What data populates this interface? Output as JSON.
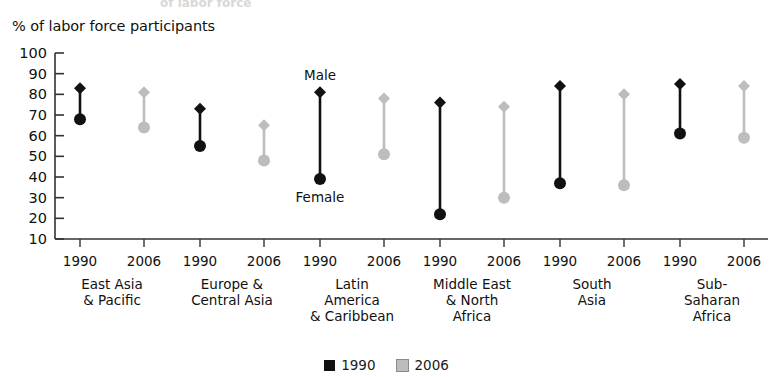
{
  "ghost_top_text": "of labor force",
  "axis_title": "% of labor force participants",
  "annotations": {
    "male_label": "Male",
    "female_label": "Female"
  },
  "legend": {
    "items": [
      {
        "label": "1990",
        "color": "#111111",
        "swatch": "black"
      },
      {
        "label": "2006",
        "color": "#bdbdbd",
        "swatch": "gray"
      }
    ]
  },
  "colors": {
    "series_1990": "#111111",
    "series_2006": "#bdbdbd",
    "axis": "#333333",
    "background": "#ffffff"
  },
  "chart_data": {
    "type": "scatter",
    "title": "% of labor force participants",
    "xlabel": "",
    "ylabel": "% of labor force participants",
    "ylim": [
      10,
      100
    ],
    "ytick_step": 10,
    "yticks": [
      10,
      20,
      30,
      40,
      50,
      60,
      70,
      80,
      90,
      100
    ],
    "grid": false,
    "legend_position": "bottom-center",
    "marker_top": "diamond (Male)",
    "marker_bottom": "circle (Female)",
    "categories": [
      "East Asia\n& Pacific",
      "Europe &\nCentral Asia",
      "Latin\nAmerica\n& Caribbean",
      "Middle East\n& North\nAfrica",
      "South\nAsia",
      "Sub-Saharan\nAfrica"
    ],
    "years": [
      "1990",
      "2006"
    ],
    "series": [
      {
        "name": "1990",
        "color": "#111111",
        "male": [
          83,
          73,
          81,
          76,
          84,
          85
        ],
        "female": [
          68,
          55,
          39,
          22,
          37,
          61
        ]
      },
      {
        "name": "2006",
        "color": "#bdbdbd",
        "male": [
          81,
          65,
          78,
          74,
          80,
          84
        ],
        "female": [
          64,
          48,
          51,
          30,
          36,
          59
        ]
      }
    ],
    "points": [
      {
        "region": "East Asia & Pacific",
        "year": "1990",
        "male": 83,
        "female": 68
      },
      {
        "region": "East Asia & Pacific",
        "year": "2006",
        "male": 81,
        "female": 64
      },
      {
        "region": "Europe & Central Asia",
        "year": "1990",
        "male": 73,
        "female": 55
      },
      {
        "region": "Europe & Central Asia",
        "year": "2006",
        "male": 65,
        "female": 48
      },
      {
        "region": "Latin America & Caribbean",
        "year": "1990",
        "male": 81,
        "female": 39
      },
      {
        "region": "Latin America & Caribbean",
        "year": "2006",
        "male": 78,
        "female": 51
      },
      {
        "region": "Middle East & North Africa",
        "year": "1990",
        "male": 76,
        "female": 22
      },
      {
        "region": "Middle East & North Africa",
        "year": "2006",
        "male": 74,
        "female": 30
      },
      {
        "region": "South Asia",
        "year": "1990",
        "male": 84,
        "female": 37
      },
      {
        "region": "South Asia",
        "year": "2006",
        "male": 80,
        "female": 36
      },
      {
        "region": "Sub-Saharan Africa",
        "year": "1990",
        "male": 85,
        "female": 61
      },
      {
        "region": "Sub-Saharan Africa",
        "year": "2006",
        "male": 84,
        "female": 59
      }
    ]
  },
  "layout": {
    "axis_x": 55,
    "axis_top_y": 53,
    "axis_bottom_y": 239,
    "group_centers": [
      112,
      232,
      352,
      472,
      592,
      712
    ],
    "year_offset": 32
  }
}
